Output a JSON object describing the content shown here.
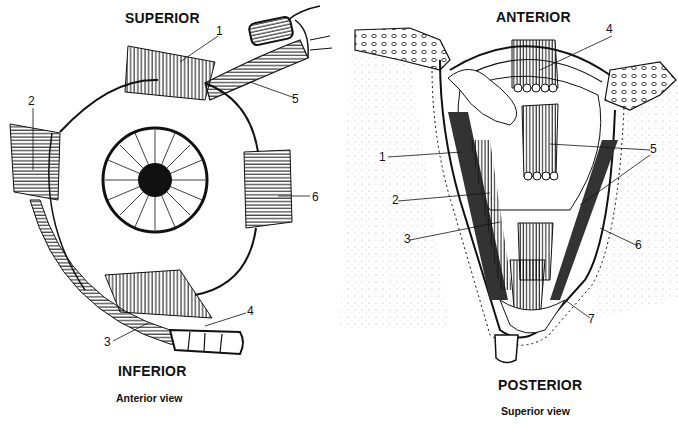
{
  "left_panel": {
    "top_label": "SUPERIOR",
    "bottom_label": "INFERIOR",
    "caption": "Anterior view",
    "callouts": [
      "1",
      "2",
      "3",
      "4",
      "5",
      "6"
    ]
  },
  "right_panel": {
    "top_label": "ANTERIOR",
    "bottom_label": "POSTERIOR",
    "caption": "Superior view",
    "callouts": [
      "1",
      "2",
      "3",
      "4",
      "5",
      "6",
      "7"
    ]
  },
  "colors": {
    "ink": "#111111",
    "background": "#ffffff",
    "stipple": "#9a9a9a"
  }
}
